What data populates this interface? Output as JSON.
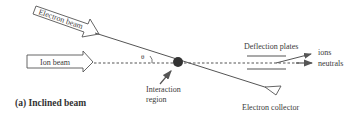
{
  "diagram": {
    "caption": "(a) Inclined beam",
    "labels": {
      "electron_beam": "Electron beam",
      "ion_beam": "Ion beam",
      "theta": "θ",
      "deflection_plates": "Deflection plates",
      "ions": "ions",
      "neutrals": "neutrals",
      "interaction_region_line1": "Interaction",
      "interaction_region_line2": "region",
      "electron_collector": "Electron collector"
    },
    "colors": {
      "line": "#555555",
      "dot": "#333333",
      "text": "#3a3a3a",
      "background": "#ffffff"
    }
  }
}
